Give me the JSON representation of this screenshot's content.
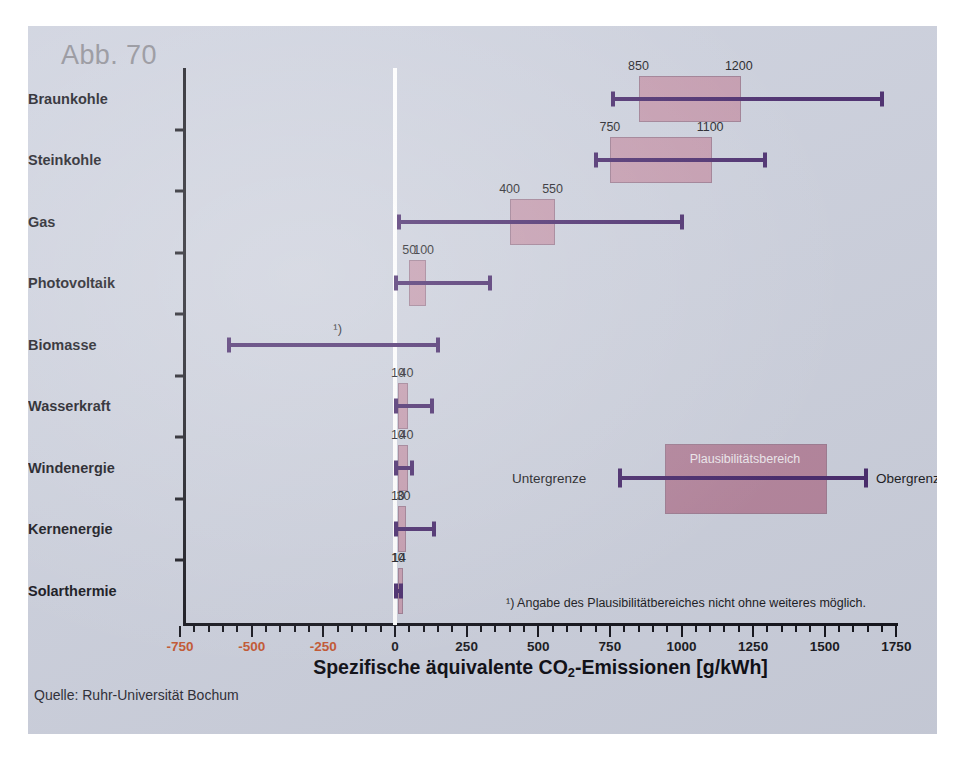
{
  "figure": {
    "label": "Abb. 70",
    "source": "Quelle: Ruhr-Universität Bochum",
    "background_color": "#ccd0dd",
    "box_fill_color": "#c49aae",
    "line_color": "#47286b",
    "negative_tick_color": "#c4552f"
  },
  "axis_title": {
    "prefix": "Spezifische äquivalente CO",
    "sub": "2",
    "suffix": "-Emissionen [g/kWh]",
    "full": "Spezifische äquivalente CO2-Emissionen [g/kWh]"
  },
  "legend": {
    "lower_label": "Untergrenze",
    "upper_label": "Obergrenze",
    "box_label": "Plausibilitätsbereich"
  },
  "footnote": {
    "marker": "¹)",
    "text": "¹) Angabe des Plausibilitätbereiches nicht ohne weiteres möglich."
  },
  "chart_data": {
    "type": "bar",
    "title": "Abb. 70",
    "xlabel": "Spezifische äquivalente CO2-Emissionen [g/kWh]",
    "ylabel": "",
    "xlim": [
      -750,
      1750
    ],
    "grid": false,
    "legend_position": "inside-right",
    "tick_values": [
      -750,
      -500,
      -250,
      0,
      250,
      500,
      750,
      1000,
      1250,
      1500,
      1750
    ],
    "tick_labels": [
      "-750",
      "-500",
      "-250",
      "0",
      "250",
      "500",
      "750",
      "1000",
      "1250",
      "1500",
      "1750"
    ],
    "minor_tick_step": 50,
    "categories": [
      "Braunkohle",
      "Steinkohle",
      "Gas",
      "Photovoltaik",
      "Biomasse",
      "Wasserkraft",
      "Windenergie",
      "Kernenergie",
      "Solarthermie"
    ],
    "series": [
      {
        "name": "Untergrenze",
        "values": [
          760,
          700,
          15,
          5,
          -580,
          5,
          5,
          5,
          5
        ]
      },
      {
        "name": "Plausibilitätsbereich unten",
        "values": [
          850,
          750,
          400,
          50,
          null,
          10,
          10,
          10,
          10
        ]
      },
      {
        "name": "Plausibilitätsbereich oben",
        "values": [
          1200,
          1100,
          550,
          100,
          null,
          40,
          40,
          30,
          14
        ]
      },
      {
        "name": "Obergrenze",
        "values": [
          1700,
          1290,
          1000,
          330,
          150,
          130,
          60,
          135,
          22
        ]
      }
    ],
    "rows": [
      {
        "category": "Braunkohle",
        "low": 760,
        "box_low": 850,
        "box_high": 1200,
        "high": 1700,
        "label_low": "850",
        "label_high": "1200",
        "footnote": false
      },
      {
        "category": "Steinkohle",
        "low": 700,
        "box_low": 750,
        "box_high": 1100,
        "high": 1290,
        "label_low": "750",
        "label_high": "1100",
        "footnote": false
      },
      {
        "category": "Gas",
        "low": 15,
        "box_low": 400,
        "box_high": 550,
        "high": 1000,
        "label_low": "400",
        "label_high": "550",
        "footnote": false
      },
      {
        "category": "Photovoltaik",
        "low": 5,
        "box_low": 50,
        "box_high": 100,
        "high": 330,
        "label_low": "50",
        "label_high": "100",
        "footnote": false
      },
      {
        "category": "Biomasse",
        "low": -580,
        "box_low": null,
        "box_high": null,
        "high": 150,
        "label_low": "",
        "label_high": "",
        "footnote": true
      },
      {
        "category": "Wasserkraft",
        "low": 5,
        "box_low": 10,
        "box_high": 40,
        "high": 130,
        "label_low": "10",
        "label_high": "40",
        "footnote": false
      },
      {
        "category": "Windenergie",
        "low": 5,
        "box_low": 10,
        "box_high": 40,
        "high": 60,
        "label_low": "10",
        "label_high": "40",
        "footnote": false
      },
      {
        "category": "Kernenergie",
        "low": 5,
        "box_low": 10,
        "box_high": 30,
        "high": 135,
        "label_low": "10",
        "label_high": "30",
        "footnote": false
      },
      {
        "category": "Solarthermie",
        "low": 5,
        "box_low": 10,
        "box_high": 14,
        "high": 22,
        "label_low": "10",
        "label_high": "14",
        "footnote": false
      }
    ]
  }
}
